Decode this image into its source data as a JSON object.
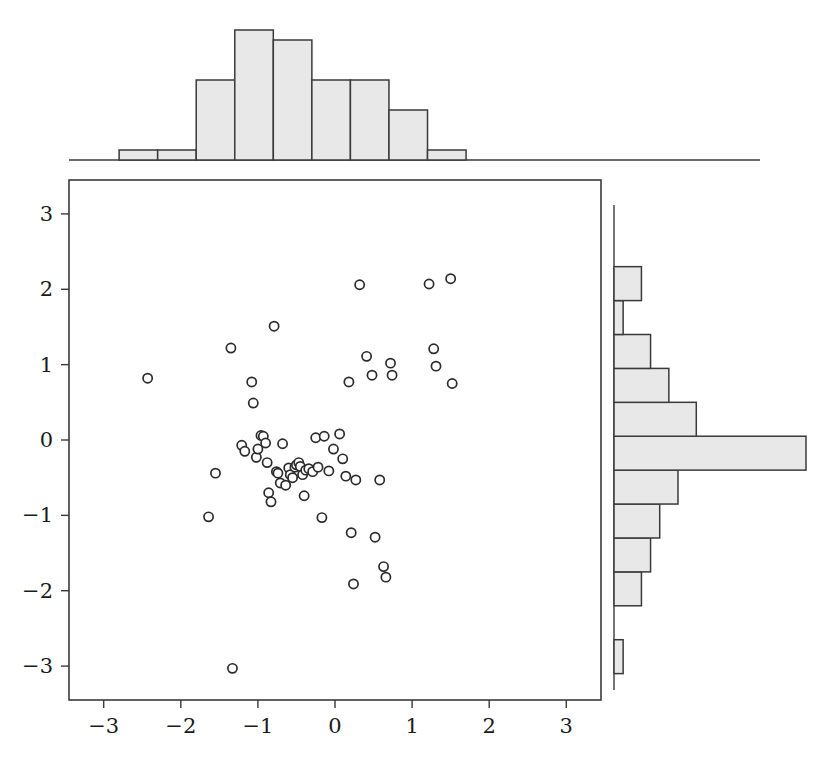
{
  "figure": {
    "title": "",
    "background_color": "#ffffff",
    "marker_edge_color": "#2b2b2b",
    "marker_face_color": "#ffffff",
    "hist_fill_color": "#e8e8e8",
    "hist_edge_color": "#3a3a3a",
    "axis_color": "#3a3a3a"
  },
  "chart_data": {
    "type": "scatter",
    "title": "",
    "xlabel": "",
    "ylabel": "",
    "xlim": [
      -3.45,
      3.45
    ],
    "ylim": [
      -3.45,
      3.45
    ],
    "grid": false,
    "legend": "none",
    "xticks": [
      -3,
      -2,
      -1,
      0,
      1,
      2,
      3
    ],
    "xtick_labels": [
      "−3",
      "−2",
      "−1",
      "0",
      "1",
      "2",
      "3"
    ],
    "yticks": [
      -3,
      -2,
      -1,
      0,
      1,
      2,
      3
    ],
    "ytick_labels": [
      "−3",
      "−2",
      "−1",
      "0",
      "1",
      "2",
      "3"
    ],
    "n_points": 60,
    "points": [
      [
        -2.43,
        0.82
      ],
      [
        -1.35,
        1.22
      ],
      [
        -1.55,
        -0.44
      ],
      [
        -1.64,
        -1.02
      ],
      [
        -1.33,
        -3.03
      ],
      [
        -1.21,
        -0.07
      ],
      [
        -1.17,
        -0.15
      ],
      [
        -1.08,
        0.77
      ],
      [
        -1.06,
        0.49
      ],
      [
        -1.02,
        -0.23
      ],
      [
        -1.0,
        -0.12
      ],
      [
        -0.96,
        0.06
      ],
      [
        -0.93,
        0.05
      ],
      [
        -0.9,
        -0.04
      ],
      [
        -0.88,
        -0.3
      ],
      [
        -0.86,
        -0.7
      ],
      [
        -0.83,
        -0.82
      ],
      [
        -0.79,
        1.51
      ],
      [
        -0.76,
        -0.42
      ],
      [
        -0.74,
        -0.44
      ],
      [
        -0.71,
        -0.57
      ],
      [
        -0.68,
        -0.05
      ],
      [
        -0.64,
        -0.6
      ],
      [
        -0.6,
        -0.37
      ],
      [
        -0.58,
        -0.46
      ],
      [
        -0.55,
        -0.5
      ],
      [
        -0.52,
        -0.36
      ],
      [
        -0.5,
        -0.33
      ],
      [
        -0.47,
        -0.3
      ],
      [
        -0.45,
        -0.35
      ],
      [
        -0.42,
        -0.46
      ],
      [
        -0.4,
        -0.74
      ],
      [
        -0.38,
        -0.4
      ],
      [
        -0.34,
        -0.38
      ],
      [
        -0.29,
        -0.42
      ],
      [
        -0.25,
        0.03
      ],
      [
        -0.22,
        -0.36
      ],
      [
        -0.17,
        -1.03
      ],
      [
        -0.14,
        0.05
      ],
      [
        -0.08,
        -0.41
      ],
      [
        -0.02,
        -0.12
      ],
      [
        0.06,
        0.08
      ],
      [
        0.1,
        -0.25
      ],
      [
        0.14,
        -0.48
      ],
      [
        0.18,
        0.77
      ],
      [
        0.21,
        -1.23
      ],
      [
        0.24,
        -1.91
      ],
      [
        0.27,
        -0.53
      ],
      [
        0.32,
        2.06
      ],
      [
        0.41,
        1.11
      ],
      [
        0.48,
        0.86
      ],
      [
        0.52,
        -1.29
      ],
      [
        0.58,
        -0.53
      ],
      [
        0.63,
        -1.68
      ],
      [
        0.66,
        -1.82
      ],
      [
        0.72,
        1.02
      ],
      [
        0.74,
        0.86
      ],
      [
        1.22,
        2.07
      ],
      [
        1.28,
        1.21
      ],
      [
        1.31,
        0.98
      ],
      [
        1.5,
        2.14
      ],
      [
        1.52,
        0.75
      ]
    ],
    "top_histogram": {
      "type": "bar",
      "orientation": "vertical",
      "bin_edges": [
        -2.8,
        -2.3,
        -1.8,
        -1.3,
        -0.8,
        -0.3,
        0.2,
        0.7,
        1.2,
        1.7
      ],
      "counts": [
        1,
        1,
        8,
        13,
        12,
        8,
        8,
        5,
        1
      ],
      "ymax": 13
    },
    "right_histogram": {
      "type": "bar",
      "orientation": "horizontal",
      "bin_edges": [
        -3.1,
        -2.65,
        -2.2,
        -1.75,
        -1.3,
        -0.85,
        -0.4,
        0.05,
        0.5,
        0.95,
        1.4,
        1.85,
        2.3
      ],
      "counts": [
        1,
        0,
        3,
        4,
        5,
        7,
        21,
        9,
        6,
        4,
        1,
        3
      ],
      "xmax": 21
    }
  }
}
